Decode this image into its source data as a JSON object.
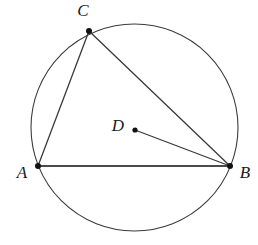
{
  "figure": {
    "background_color": "#ffffff",
    "stroke_color": "#3a3a3a",
    "point_color": "#111111",
    "chord_color": "#4a4a4a",
    "width": 258,
    "height": 245
  },
  "circle": {
    "name": "circumscribed-circle",
    "center_x": 134.5,
    "center_y": 127.5,
    "radius": 103.5,
    "stroke_width": 1.1
  },
  "points": [
    {
      "id": "A",
      "label": "A",
      "x": 38,
      "y": 166,
      "label_x": 22,
      "label_y": 174,
      "on_circle": true,
      "dot_radius": 3
    },
    {
      "id": "B",
      "label": "B",
      "x": 230,
      "y": 166,
      "label_x": 245,
      "label_y": 174,
      "on_circle": true,
      "dot_radius": 3
    },
    {
      "id": "C",
      "label": "C",
      "x": 89,
      "y": 31,
      "label_x": 83,
      "label_y": 12,
      "on_circle": true,
      "dot_radius": 3
    },
    {
      "id": "D",
      "label": "D",
      "x": 135,
      "y": 130,
      "label_x": 118,
      "label_y": 127,
      "on_circle": false,
      "dot_radius": 2.6
    }
  ],
  "segments": [
    {
      "id": "AB",
      "from": "A",
      "to": "B",
      "x1": 38,
      "y1": 166,
      "x2": 230,
      "y2": 166,
      "stroke_width": 2.0
    },
    {
      "id": "AC",
      "from": "A",
      "to": "C",
      "x1": 38,
      "y1": 166,
      "x2": 89,
      "y2": 31,
      "stroke_width": 1.3
    },
    {
      "id": "CB",
      "from": "C",
      "to": "B",
      "x1": 89,
      "y1": 31,
      "x2": 230,
      "y2": 166,
      "stroke_width": 1.3
    },
    {
      "id": "DB",
      "from": "D",
      "to": "B",
      "x1": 135,
      "y1": 130,
      "x2": 230,
      "y2": 166,
      "stroke_width": 1.3
    }
  ]
}
